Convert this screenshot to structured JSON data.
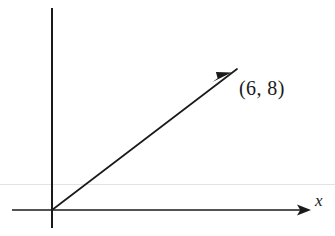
{
  "figure": {
    "background_color": "#ffffff",
    "ink_color": "#1a1a1a",
    "artifact_line_color": "#e0e0e0",
    "width": 335,
    "height": 236
  },
  "axes": {
    "x_axis": {
      "label": "x",
      "label_style": "italic",
      "has_arrowhead": true,
      "arrow_direction": "right",
      "y_pixel": 210,
      "x_start_pixel": 12,
      "x_end_pixel": 311
    },
    "y_axis": {
      "label": "",
      "has_arrowhead": false,
      "x_pixel": 52,
      "y_start_pixel": 8,
      "y_end_pixel": 228
    },
    "origin": {
      "x_pixel": 52,
      "y_pixel": 210
    }
  },
  "vector": {
    "label": "(6, 8)",
    "components": {
      "x": 6,
      "y": 8
    },
    "start": {
      "x": 0,
      "y": 0
    },
    "end": {
      "x": 6,
      "y": 8
    },
    "start_pixel": {
      "x": 52,
      "y": 210
    },
    "tip_pixel": {
      "x": 237,
      "y": 69
    },
    "arrowhead_pixel": {
      "x": 221,
      "y": 78
    },
    "has_arrowhead": true
  },
  "artifacts": {
    "scan_line": {
      "description": "faint horizontal scan artifact line",
      "y_pixel": 184,
      "color": "#e3e3e3"
    }
  }
}
